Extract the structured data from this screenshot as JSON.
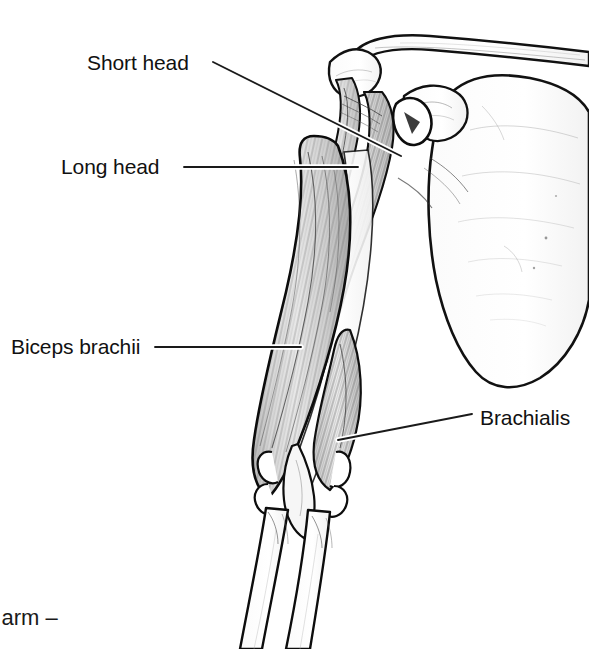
{
  "figure": {
    "type": "anatomical-line-illustration",
    "palette": {
      "background": "#ffffff",
      "ink": "#000000",
      "muscle_fill": "#d9d9d9",
      "bone_fill": "#fdfdfd",
      "leader_line": "#1a1a1a",
      "leader_halo": "#ffffff"
    }
  },
  "labels": {
    "short_head": "Short head",
    "long_head": "Long head",
    "biceps_brachii": "Biceps brachii",
    "brachialis": "Brachialis"
  },
  "caption": {
    "partial_text": "r arm –"
  },
  "leaders": [
    {
      "name": "short-head-leader",
      "from": [
        213,
        62
      ],
      "to": [
        401,
        156
      ]
    },
    {
      "name": "long-head-leader",
      "from": [
        184,
        167
      ],
      "to": [
        358,
        167
      ]
    },
    {
      "name": "biceps-brachii-leader",
      "from": [
        155,
        347
      ],
      "to": [
        301,
        347
      ]
    },
    {
      "name": "brachialis-leader",
      "from": [
        472,
        414
      ],
      "to": [
        338,
        440
      ]
    }
  ],
  "structures": [
    {
      "name": "clavicle",
      "kind": "bone"
    },
    {
      "name": "acromion",
      "kind": "bone"
    },
    {
      "name": "coracoid-process",
      "kind": "bone"
    },
    {
      "name": "scapula-body",
      "kind": "bone"
    },
    {
      "name": "humerus",
      "kind": "bone"
    },
    {
      "name": "radius",
      "kind": "bone"
    },
    {
      "name": "ulna",
      "kind": "bone"
    },
    {
      "name": "biceps-short-head",
      "kind": "muscle"
    },
    {
      "name": "biceps-long-head",
      "kind": "muscle"
    },
    {
      "name": "biceps-muscle-belly",
      "kind": "muscle"
    },
    {
      "name": "brachialis-muscle",
      "kind": "muscle"
    },
    {
      "name": "distal-biceps-tendon",
      "kind": "tendon"
    }
  ]
}
